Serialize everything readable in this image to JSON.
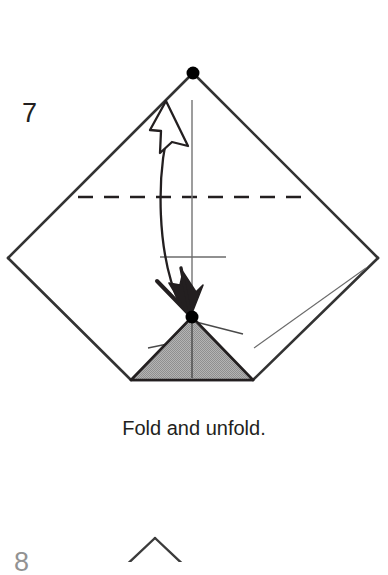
{
  "page": {
    "background_color": "#ffffff",
    "width": 388,
    "height": 562,
    "kind": "origami-instruction-diagram"
  },
  "step": {
    "number": "7",
    "caption": "Fold and unfold."
  },
  "next_step": {
    "number": "8",
    "partial": true
  },
  "colors": {
    "ink": "#231f20",
    "line": "#333333",
    "thin_crease": "#555555",
    "shaded_fill": "#ababab",
    "shaded_stroke": "#231f20",
    "dot": "#000000",
    "paper": "#ffffff"
  },
  "geometry": {
    "diamond": {
      "label": "square-rotated-45",
      "top": [
        193,
        73
      ],
      "left": [
        8,
        258
      ],
      "right": [
        378,
        258
      ],
      "bottom_left_base": [
        131,
        380
      ],
      "bottom_right_base": [
        253,
        380
      ]
    },
    "dots": [
      {
        "name": "top-vertex-dot",
        "x": 193,
        "y": 73,
        "r": 6
      },
      {
        "name": "triangle-apex-dot",
        "x": 192,
        "y": 317,
        "r": 6
      }
    ],
    "dashed_fold_line": {
      "y": 197,
      "x1": 78,
      "x2": 310
    },
    "vertical_center_line": {
      "x": 192,
      "y1": 100,
      "y2": 380
    },
    "center_tick": {
      "y": 257,
      "x1": 160,
      "x2": 226
    },
    "shaded_triangle": {
      "apex": [
        192,
        317
      ],
      "base_left": [
        131,
        380
      ],
      "base_right": [
        253,
        380
      ]
    },
    "arrows": [
      {
        "name": "unfold-arrow",
        "style": "hollow-outline-head",
        "direction": "up",
        "head_tip": [
          166,
          104
        ]
      },
      {
        "name": "fold-arrow",
        "style": "solid-filled-head",
        "direction": "down",
        "head_tip": [
          190,
          315
        ]
      }
    ],
    "next_figure_apex": [
      155,
      538
    ]
  },
  "icons": {
    "vertex_dot": "filled-circle-icon",
    "unfold_arrow": "hollow-arrow-up-icon",
    "fold_arrow": "solid-arrow-down-icon",
    "valley_fold": "dashed-line-icon"
  }
}
